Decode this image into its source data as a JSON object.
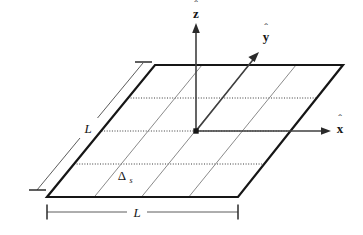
{
  "figure": {
    "background_color": "#ffffff",
    "ink_color": "#161616",
    "grid_color": "#555555",
    "labels": {
      "z_axis": "z",
      "y_axis": "y",
      "x_axis": "x",
      "side_length_left": "L",
      "side_length_bottom": "L",
      "cell_spacing": "Δ",
      "cell_spacing_subscript": "s"
    },
    "geometry": {
      "plane_corners": [
        {
          "name": "top-left",
          "x": 155,
          "y": 65
        },
        {
          "name": "top-right",
          "x": 343,
          "y": 65
        },
        {
          "name": "bottom-right",
          "x": 238,
          "y": 197
        },
        {
          "name": "bottom-left",
          "x": 47,
          "y": 197
        }
      ],
      "origin": {
        "x": 196,
        "y": 131
      },
      "grid_divisions": 4,
      "z_arrow_tip": {
        "x": 196,
        "y": 24
      },
      "y_arrow_tip": {
        "x": 258,
        "y": 52
      },
      "x_arrow_tip": {
        "x": 330,
        "y": 131
      },
      "bottom_dimension": {
        "x1": 47,
        "x2": 238,
        "y": 212
      },
      "left_dimension": {
        "x1": 143,
        "y1": 63,
        "x2": 37,
        "y2": 190
      }
    }
  }
}
